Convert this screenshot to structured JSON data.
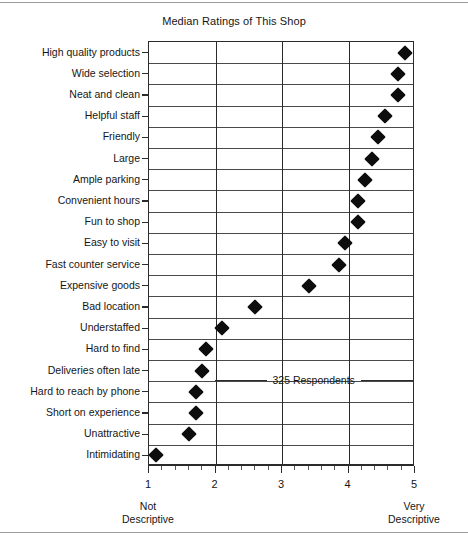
{
  "chart_data": {
    "type": "scatter",
    "orientation": "horizontal",
    "title": "Median Ratings of This Shop",
    "xlabel": "",
    "ylabel": "",
    "xlim": [
      1,
      5
    ],
    "xticks": [
      1,
      2,
      3,
      4,
      5
    ],
    "xtick_labels": [
      "1",
      "2",
      "3",
      "4",
      "5"
    ],
    "x_axis_low_label": "Not\nDescriptive",
    "x_axis_low_label_line1": "Not",
    "x_axis_low_label_line2": "Descriptive",
    "x_axis_high_label_line1": "Very",
    "x_axis_high_label_line2": "Descriptive",
    "minor_tick_step": 0.2,
    "grid": "both",
    "legend": "none",
    "marker": "diamond",
    "marker_color": "#0d0d0d",
    "annotation": "325 Respondents",
    "categories": [
      "High quality products",
      "Wide selection",
      "Neat and clean",
      "Helpful staff",
      "Friendly",
      "Large",
      "Ample parking",
      "Convenient hours",
      "Fun to shop",
      "Easy to visit",
      "Fast counter service",
      "Expensive goods",
      "Bad location",
      "Understaffed",
      "Hard to find",
      "Deliveries often late",
      "Hard to reach by phone",
      "Short on experience",
      "Unattractive",
      "Intimidating"
    ],
    "values": [
      4.85,
      4.75,
      4.75,
      4.55,
      4.45,
      4.35,
      4.25,
      4.15,
      4.15,
      3.95,
      3.85,
      3.4,
      2.6,
      2.1,
      1.85,
      1.8,
      1.7,
      1.7,
      1.6,
      1.1
    ]
  }
}
